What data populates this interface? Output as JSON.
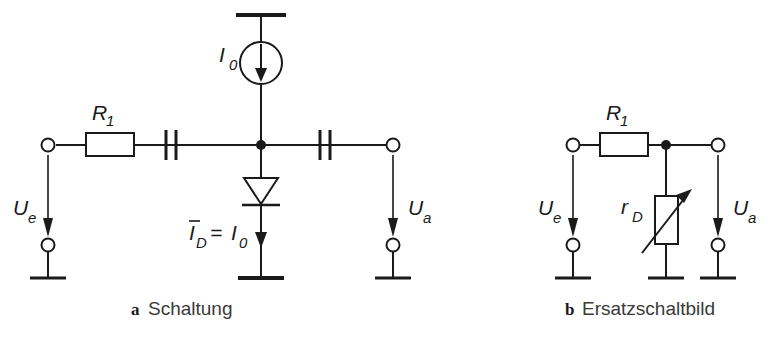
{
  "figure": {
    "background_color": "#ffffff",
    "line_color": "#1a1a1a",
    "text_color": "#3a3a3a"
  },
  "circuits": [
    {
      "id": "a",
      "caption_letter": "a",
      "caption_text": "Schaltung",
      "labels": {
        "source": "I",
        "source_sub": "0",
        "resistor": "R",
        "resistor_sub": "1",
        "input_voltage": "U",
        "input_voltage_sub": "e",
        "output_voltage": "U",
        "output_voltage_sub": "a",
        "diode_current_lhs": "I",
        "diode_current_lhs_sub": "D",
        "diode_current_eq": "=",
        "diode_current_rhs": "I",
        "diode_current_rhs_sub": "0"
      },
      "components": [
        "supply-rail",
        "current-source",
        "resistor-r1",
        "coupling-capacitor-input",
        "coupling-capacitor-output",
        "diode",
        "ground-rail",
        "input-terminal-top",
        "input-terminal-bottom",
        "output-terminal-top",
        "output-terminal-bottom"
      ]
    },
    {
      "id": "b",
      "caption_letter": "b",
      "caption_text": "Ersatzschaltbild",
      "labels": {
        "resistor": "R",
        "resistor_sub": "1",
        "variable_resistor": "r",
        "variable_resistor_sub": "D",
        "input_voltage": "U",
        "input_voltage_sub": "e",
        "output_voltage": "U",
        "output_voltage_sub": "a"
      },
      "components": [
        "resistor-r1",
        "variable-resistor-rd",
        "junction-node",
        "ground-rail",
        "input-terminal-top",
        "input-terminal-bottom",
        "output-terminal-top",
        "output-terminal-bottom"
      ]
    }
  ]
}
